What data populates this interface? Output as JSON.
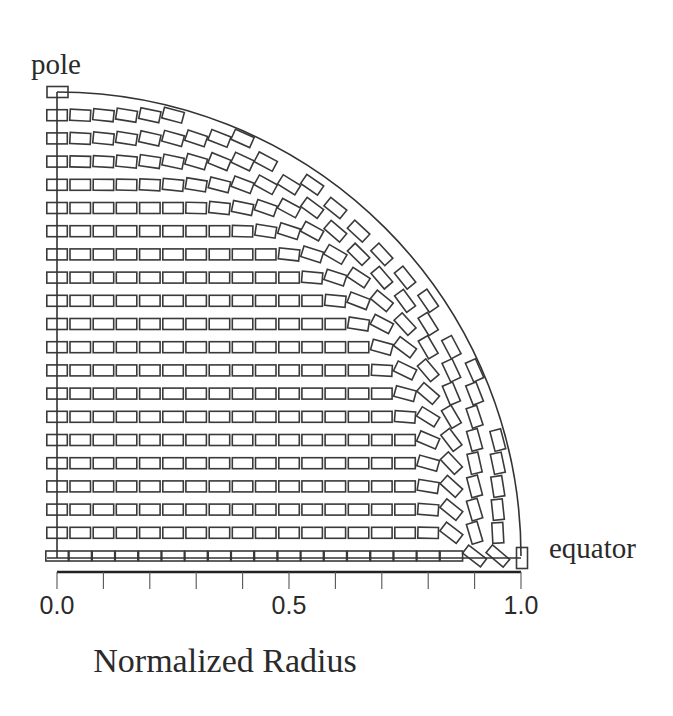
{
  "chart_data": {
    "type": "diagram",
    "title": "",
    "labels": {
      "pole": "pole",
      "equator": "equator",
      "xlabel": "Normalized Radius"
    },
    "xaxis": {
      "range": [
        0.0,
        1.0
      ],
      "major_ticks": [
        0.0,
        0.5,
        1.0
      ],
      "tick_labels": [
        "0.0",
        "0.5",
        "1.0"
      ],
      "minor_tick_step": 0.1,
      "num_ticks": 11
    },
    "geometry": {
      "boundary": "quarter circle of radius 1.0 (pole at top, equator at right)",
      "grid_rows": 21,
      "grid_step_normalized": 0.05,
      "cell_aspect": "approx 2:1 (width:height)"
    },
    "colors": {
      "stroke": "#3a3a3a",
      "background": "#ffffff"
    }
  }
}
